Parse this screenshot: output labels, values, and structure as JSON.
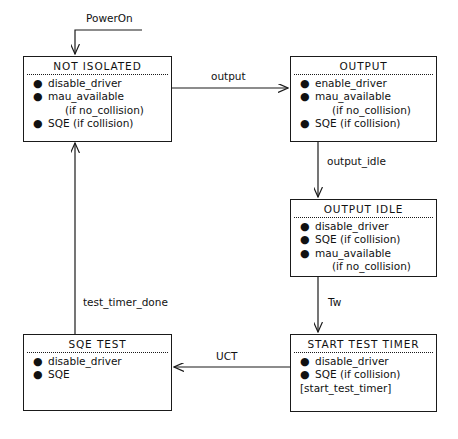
{
  "diagram": {
    "type": "state-machine",
    "stroke_color": "#1a1a1a",
    "background_color": "#ffffff",
    "states": [
      {
        "id": "not-isolated",
        "title": "NOT ISOLATED",
        "actions": [
          {
            "bullet": "●",
            "text": "disable_driver"
          },
          {
            "bullet": "●",
            "text": "mau_available"
          },
          {
            "bullet": "",
            "text": "(if no_collision)",
            "continuation": true
          },
          {
            "bullet": "●",
            "text": "SQE (if collision)"
          }
        ]
      },
      {
        "id": "output",
        "title": "OUTPUT",
        "actions": [
          {
            "bullet": "●",
            "text": "enable_driver"
          },
          {
            "bullet": "●",
            "text": "mau_available"
          },
          {
            "bullet": "",
            "text": "(if no_collision)",
            "continuation": true
          },
          {
            "bullet": "●",
            "text": "SQE (if collision)"
          }
        ]
      },
      {
        "id": "output-idle",
        "title": "OUTPUT IDLE",
        "actions": [
          {
            "bullet": "●",
            "text": "disable_driver"
          },
          {
            "bullet": "●",
            "text": "SQE (if collision)"
          },
          {
            "bullet": "●",
            "text": "mau_available"
          },
          {
            "bullet": "",
            "text": "(if no_collision)",
            "continuation": true
          }
        ]
      },
      {
        "id": "start-test-timer",
        "title": "START TEST TIMER",
        "actions": [
          {
            "bullet": "●",
            "text": "disable_driver"
          },
          {
            "bullet": "●",
            "text": "SQE (if collision)"
          },
          {
            "bullet": "",
            "text": "[start_test_timer]",
            "bracketed": true
          }
        ]
      },
      {
        "id": "sqe-test",
        "title": "SQE TEST",
        "actions": [
          {
            "bullet": "●",
            "text": "disable_driver"
          },
          {
            "bullet": "●",
            "text": "SQE"
          }
        ]
      }
    ],
    "transitions": [
      {
        "id": "power-on",
        "label": "PowerOn",
        "from": "start",
        "to": "not-isolated"
      },
      {
        "id": "output",
        "label": "output",
        "from": "not-isolated",
        "to": "output"
      },
      {
        "id": "output-idle",
        "label": "output_idle",
        "from": "output",
        "to": "output-idle"
      },
      {
        "id": "tw",
        "label": "Tw",
        "from": "output-idle",
        "to": "start-test-timer"
      },
      {
        "id": "uct",
        "label": "UCT",
        "from": "start-test-timer",
        "to": "sqe-test"
      },
      {
        "id": "test-timer-done",
        "label": "test_timer_done",
        "from": "sqe-test",
        "to": "not-isolated"
      }
    ]
  }
}
